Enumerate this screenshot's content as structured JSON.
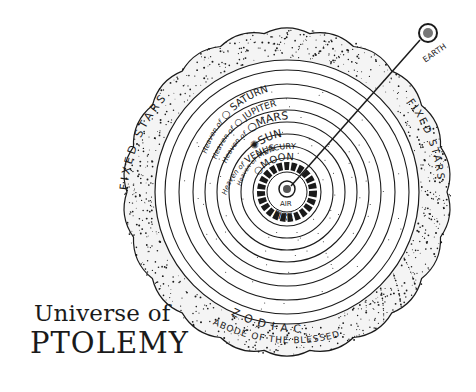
{
  "title": {
    "line1": "Universe of",
    "line2": "PTOLEMY"
  },
  "spheres": [
    {
      "prefix": "Heaven of",
      "name": "SATURN"
    },
    {
      "prefix": "Heaven of",
      "name": "JUPITER"
    },
    {
      "prefix": "Heaven of",
      "name": "MARS"
    },
    {
      "prefix": "",
      "name": "SUN"
    },
    {
      "prefix": "Heaven of",
      "name": "VENUS"
    },
    {
      "prefix": "Heaven of",
      "name": "MERCURY"
    },
    {
      "prefix": "",
      "name": "MOON"
    }
  ],
  "inner_elements": {
    "fire": "FIRE",
    "air": "AIR"
  },
  "outer_labels": {
    "fixed_stars_left": "FIXED STARS",
    "fixed_stars_right": "FIXED STARS",
    "zodiac": "ZODIAC",
    "abode": "ABODE OF THE BLESSED"
  },
  "earth_label": "EARTH",
  "colors": {
    "ink": "#1a1a1a",
    "paper": "#ffffff"
  }
}
